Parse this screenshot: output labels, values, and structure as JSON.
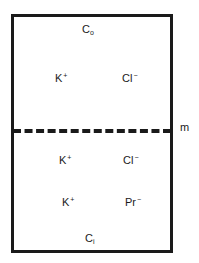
{
  "diagram": {
    "compartments": {
      "outside": {
        "concentration_label": {
          "base": "C",
          "sub": "o"
        },
        "ions": [
          {
            "base": "K",
            "charge": "+"
          },
          {
            "base": "Cl",
            "charge": "−"
          }
        ]
      },
      "inside": {
        "concentration_label": {
          "base": "C",
          "sub": "i"
        },
        "ions": [
          {
            "base": "K",
            "charge": "+"
          },
          {
            "base": "Cl",
            "charge": "−"
          },
          {
            "base": "K",
            "charge": "+"
          },
          {
            "base": "Pr",
            "charge": "−"
          }
        ]
      }
    },
    "membrane_label": "m",
    "colors": {
      "stroke": "#1a1a1a",
      "background": "#ffffff"
    }
  }
}
